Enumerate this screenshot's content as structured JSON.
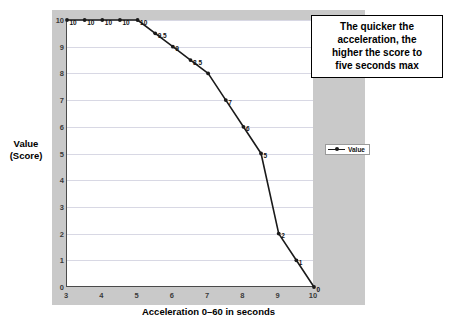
{
  "chart_data": {
    "type": "line",
    "title": "",
    "xlabel": "Acceleration 0–60 in seconds",
    "ylabel": "Value (Score)",
    "ylabel_line1": "Value",
    "ylabel_line2": "(Score)",
    "xlim": [
      3,
      10
    ],
    "ylim": [
      0,
      10
    ],
    "grid": true,
    "legend_position": "right",
    "series": [
      {
        "name": "Value",
        "x": [
          3,
          3.5,
          4,
          4.5,
          5,
          5.5,
          6,
          6.5,
          7,
          7.5,
          8,
          8.5,
          9,
          9.5,
          10
        ],
        "values": [
          10,
          10,
          10,
          10,
          10,
          9.5,
          9,
          8.5,
          8,
          7,
          6,
          5,
          2,
          1,
          0
        ],
        "point_labels": [
          "10",
          "10",
          "10",
          "10",
          "10",
          "9.5",
          "9",
          "8.5",
          "",
          "7",
          "6",
          "5",
          "2",
          "1",
          "0"
        ]
      }
    ],
    "xticks": [
      "3",
      "4",
      "5",
      "6",
      "7",
      "8",
      "9",
      "10"
    ],
    "xtick_values": [
      3,
      4,
      5,
      6,
      7,
      8,
      9,
      10
    ],
    "yticks": [
      "0",
      "1",
      "2",
      "3",
      "4",
      "5",
      "6",
      "7",
      "8",
      "9",
      "10"
    ],
    "ytick_values": [
      0,
      1,
      2,
      3,
      4,
      5,
      6,
      7,
      8,
      9,
      10
    ],
    "annotation": "The quicker the acceleration, the higher the score to five seconds max",
    "annotation_lines": [
      "The quicker the",
      "acceleration, the",
      "higher the score to",
      "five seconds max"
    ],
    "legend": [
      "Value"
    ],
    "colors": {
      "line": "#1a1a1a",
      "marker": "#1a1a1a",
      "plot_background": "#ffffff",
      "chart_background": "#c9c9c9",
      "gridline": "#d8d8e4",
      "axis": "#4a4a4a",
      "text": "#000000"
    }
  },
  "legend": {
    "series_label": "Value"
  },
  "axes": {
    "y_title_line1": "Value",
    "y_title_line2": "(Score)",
    "x_title": "Acceleration 0–60 in seconds"
  }
}
